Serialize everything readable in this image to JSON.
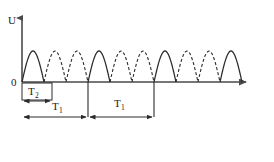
{
  "figure": {
    "background_color": "#ffffff",
    "line_color": "#2b2b2b",
    "axis_color": "#4a4a4a"
  },
  "axes": {
    "y_axis_label": "U",
    "origin_label": "0",
    "y_axis": {
      "x": 22,
      "y_top": 14,
      "y_bottom": 82,
      "arrow": "up"
    },
    "x_axis": {
      "y": 82,
      "x_left": 22,
      "x_right": 252,
      "arrow": "right"
    }
  },
  "chart_data": {
    "type": "line",
    "title": "",
    "xlabel": "",
    "ylabel": "U",
    "grid": false,
    "legend": "none",
    "baseline_y": 82,
    "peak_height": 31,
    "arch_width": 22.0,
    "arch_start_x": 22,
    "arch_count": 10,
    "arches_per_period": 3,
    "solid_arch_indices": [
      0,
      3,
      6,
      9
    ],
    "series": [
      {
        "name": "solid-half-wave",
        "style": "solid",
        "values": [
          0,
          1,
          0
        ]
      },
      {
        "name": "dashed-half-wave",
        "style": "dashed",
        "values": [
          0,
          1,
          0
        ]
      }
    ],
    "periods": [
      {
        "label": "T1",
        "start_x": 22,
        "end_x": 88
      },
      {
        "label": "T1",
        "start_x": 88,
        "end_x": 154
      }
    ]
  },
  "annotations": {
    "t2": {
      "label": "T",
      "subscript": "2",
      "box": {
        "x": 22,
        "y": 83,
        "width": 30,
        "height": 17
      },
      "arrow": {
        "y": 96,
        "x_start": 23,
        "x_end": 51,
        "type": "double-headed"
      }
    },
    "t1_first": {
      "label": "T",
      "subscript": "1",
      "text_x": 52,
      "text_y": 106,
      "arrow": {
        "y": 114,
        "x_start": 23,
        "x_end": 87,
        "type": "double-headed"
      }
    },
    "t1_second": {
      "label": "T",
      "subscript": "1",
      "text_x": 118,
      "text_y": 104,
      "arrow": {
        "y": 114,
        "x_start": 89,
        "x_end": 153,
        "type": "double-headed"
      }
    },
    "dividers": [
      {
        "x": 88,
        "y_top": 82,
        "y_bottom": 117
      },
      {
        "x": 154,
        "y_top": 82,
        "y_bottom": 117
      }
    ]
  }
}
